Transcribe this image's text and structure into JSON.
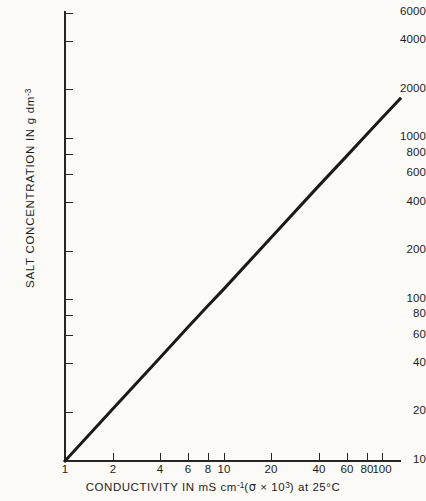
{
  "chart_data": {
    "type": "line",
    "title": "",
    "xlabel": "CONDUCTIVITY IN mS cm-1 (sigma x 10^3) at 25C",
    "ylabel": "SALT CONCENTRATION IN g dm-3",
    "xscale": "log",
    "yscale": "log",
    "xlim": [
      1,
      130
    ],
    "ylim": [
      10,
      6000
    ],
    "grid": false,
    "legend": null,
    "x_ticks": [
      {
        "value": 1,
        "label": "1"
      },
      {
        "value": 2,
        "label": "2"
      },
      {
        "value": 4,
        "label": "4"
      },
      {
        "value": 6,
        "label": "6"
      },
      {
        "value": 8,
        "label": "8"
      },
      {
        "value": 10,
        "label": "10"
      },
      {
        "value": 20,
        "label": "20"
      },
      {
        "value": 40,
        "label": "40"
      },
      {
        "value": 60,
        "label": "60"
      },
      {
        "value": 80,
        "label": "80"
      },
      {
        "value": 100,
        "label": "100"
      }
    ],
    "y_ticks": [
      {
        "value": 10,
        "label": "10"
      },
      {
        "value": 20,
        "label": "20"
      },
      {
        "value": 40,
        "label": "40"
      },
      {
        "value": 60,
        "label": "60"
      },
      {
        "value": 80,
        "label": "80"
      },
      {
        "value": 100,
        "label": "100"
      },
      {
        "value": 200,
        "label": "200"
      },
      {
        "value": 400,
        "label": "400"
      },
      {
        "value": 600,
        "label": "600"
      },
      {
        "value": 800,
        "label": "800"
      },
      {
        "value": 1000,
        "label": "1000"
      },
      {
        "value": 2000,
        "label": "2000"
      },
      {
        "value": 4000,
        "label": "4000"
      },
      {
        "value": 6000,
        "label": "6000"
      }
    ],
    "series": [
      {
        "name": "salt concentration vs conductivity",
        "x": [
          1,
          2,
          4,
          6,
          8,
          10,
          20,
          40,
          60,
          80,
          100,
          130
        ],
        "y": [
          10,
          21,
          44,
          68,
          92,
          116,
          243,
          510,
          780,
          1060,
          1340,
          1760
        ],
        "color": "#1a1a1a",
        "width": 3
      }
    ]
  },
  "axis_titles": {
    "x_prefix": "CONDUCTIVITY IN mS cm",
    "x_sup1": "-1",
    "x_mid_open": "(",
    "x_sigma": "σ",
    "x_times": " × 10",
    "x_sup2": "3",
    "x_mid_close": ")",
    "x_suffix": " at 25°C",
    "y_prefix": "SALT CONCENTRATION IN g  dm",
    "y_sup": "-3"
  },
  "colors": {
    "background": "#fbfaf7",
    "axis": "#262626",
    "line": "#1a1a1a",
    "text": "#1d1d1d"
  }
}
